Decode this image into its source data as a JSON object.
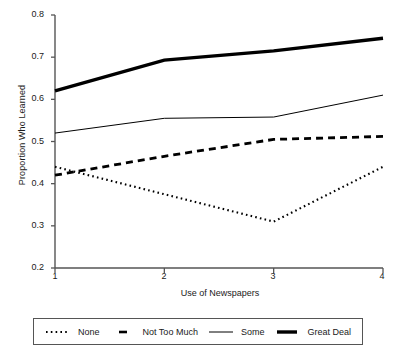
{
  "chart_data": {
    "type": "line",
    "title": "",
    "xlabel": "Use of Newspapers",
    "ylabel": "Proportion Who Learned",
    "x": [
      1,
      2,
      3,
      4
    ],
    "xtick_labels": [
      "1",
      "2",
      "3",
      "4"
    ],
    "ytick_labels": [
      "0.2",
      "0.3",
      "0.4",
      "0.5",
      "0.6",
      "0.7",
      "0.8"
    ],
    "yticks": [
      0.2,
      0.3,
      0.4,
      0.5,
      0.6,
      0.7,
      0.8
    ],
    "xlim": [
      1,
      4
    ],
    "ylim": [
      0.2,
      0.8
    ],
    "grid": false,
    "legend_position": "below-axes",
    "series": [
      {
        "name": "None",
        "style": "dotted",
        "color": "#000000",
        "values": [
          0.44,
          0.375,
          0.31,
          0.44
        ]
      },
      {
        "name": "Not Too Much",
        "style": "dashed",
        "color": "#000000",
        "values": [
          0.42,
          0.465,
          0.505,
          0.512
        ]
      },
      {
        "name": "Some",
        "style": "solid-thin",
        "color": "#000000",
        "values": [
          0.52,
          0.555,
          0.558,
          0.61
        ]
      },
      {
        "name": "Great Deal",
        "style": "solid-thick",
        "color": "#000000",
        "values": [
          0.62,
          0.693,
          0.715,
          0.745
        ]
      }
    ]
  },
  "axes": {
    "ylabel": "Proportion Who Learned",
    "xlabel": "Use of Newspapers",
    "ytick_0": "0.8",
    "ytick_1": "0.7",
    "ytick_2": "0.6",
    "ytick_3": "0.5",
    "ytick_4": "0.4",
    "ytick_5": "0.3",
    "ytick_6": "0.2",
    "xtick_0": "1",
    "xtick_1": "2",
    "xtick_2": "3",
    "xtick_3": "4"
  },
  "legend": {
    "items": [
      {
        "label": "None"
      },
      {
        "label": "Not Too Much"
      },
      {
        "label": "Some"
      },
      {
        "label": "Great Deal"
      }
    ]
  }
}
